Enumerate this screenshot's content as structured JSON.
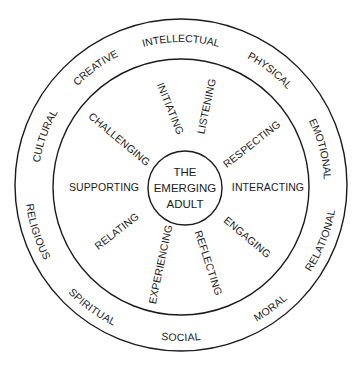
{
  "diagram": {
    "center": {
      "lines": [
        "THE",
        "EMERGING",
        "ADULT"
      ]
    },
    "actions": [
      {
        "label": "INITIATING"
      },
      {
        "label": "LISTENING"
      },
      {
        "label": "RESPECTING"
      },
      {
        "label": "INTERACTING"
      },
      {
        "label": "ENGAGING"
      },
      {
        "label": "REFLECTING"
      },
      {
        "label": "EXPERIENCING"
      },
      {
        "label": "RELATING"
      },
      {
        "label": "SUPPORTING"
      },
      {
        "label": "CHALLENGING"
      }
    ],
    "dimensions": [
      {
        "label": "INTELLECTUAL"
      },
      {
        "label": "PHYSICAL"
      },
      {
        "label": "EMOTIONAL"
      },
      {
        "label": "RELATIONAL"
      },
      {
        "label": "MORAL"
      },
      {
        "label": "SOCIAL"
      },
      {
        "label": "SPIRITUAL"
      },
      {
        "label": "RELIGIOUS"
      },
      {
        "label": "CULTURAL"
      },
      {
        "label": "CREATIVE"
      }
    ]
  }
}
